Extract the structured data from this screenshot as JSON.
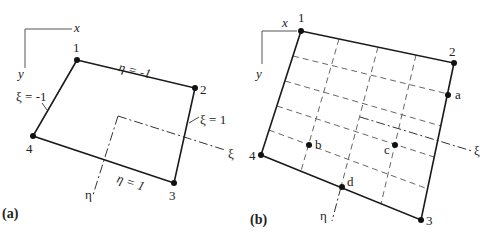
{
  "panel_a": {
    "label": "(a)",
    "frame": {
      "x_label": "x",
      "y_label": "y"
    },
    "nodes": [
      {
        "id": "1",
        "x": 77,
        "y": 60
      },
      {
        "id": "2",
        "x": 195,
        "y": 88
      },
      {
        "id": "3",
        "x": 174,
        "y": 183
      },
      {
        "id": "4",
        "x": 33,
        "y": 136
      }
    ],
    "edge_labels": {
      "top": "η = -1",
      "bottom": "η = 1",
      "left": "ξ = -1",
      "right": "ξ = 1"
    },
    "axes": {
      "xi": "ξ",
      "eta": "η"
    }
  },
  "panel_b": {
    "label": "(b)",
    "frame": {
      "x_label": "x",
      "y_label": "y"
    },
    "nodes": [
      {
        "id": "1",
        "x": 301,
        "y": 31
      },
      {
        "id": "2",
        "x": 454,
        "y": 63
      },
      {
        "id": "3",
        "x": 421,
        "y": 220
      },
      {
        "id": "4",
        "x": 261,
        "y": 155
      }
    ],
    "points": [
      {
        "id": "a",
        "x": 448,
        "y": 95
      },
      {
        "id": "b",
        "x": 309,
        "y": 145
      },
      {
        "id": "c",
        "x": 395,
        "y": 145
      },
      {
        "id": "d",
        "x": 342,
        "y": 187
      }
    ],
    "axes": {
      "xi": "ξ",
      "eta": "η"
    },
    "grid": {
      "columns": 4,
      "rows": 5
    }
  }
}
